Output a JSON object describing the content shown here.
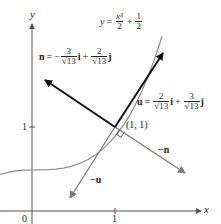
{
  "diagram": {
    "type": "vector-diagram",
    "axes": {
      "x_label": "x",
      "y_label": "y",
      "x_ticks": [
        {
          "value": 0,
          "label": "0"
        },
        {
          "value": 1,
          "label": "1"
        }
      ],
      "y_ticks": [
        {
          "value": 1,
          "label": "1"
        }
      ]
    },
    "curve": {
      "label_lhs": "y",
      "equals": "=",
      "term1_num": "x³",
      "term1_den": "2",
      "plus": "+",
      "term2_num": "1",
      "term2_den": "2",
      "color": "#8a8a8a"
    },
    "point": {
      "label": "(1, 1)"
    },
    "vectors": {
      "n": {
        "name": "n",
        "equals": "=",
        "minus": "−",
        "i_num": "3",
        "i_den": "√13",
        "i_unit": "i",
        "plus": "+",
        "j_num": "2",
        "j_den": "√13",
        "j_unit": "j",
        "color": "#111111"
      },
      "u": {
        "name": "u",
        "equals": "=",
        "i_num": "2",
        "i_den": "√13",
        "i_unit": "i",
        "plus": "+",
        "j_num": "3",
        "j_den": "√13",
        "j_unit": "j",
        "color": "#111111"
      },
      "neg_n": {
        "label": "−n",
        "color": "#7a7a7a"
      },
      "neg_u": {
        "label": "−u",
        "color": "#7a7a7a"
      }
    }
  }
}
